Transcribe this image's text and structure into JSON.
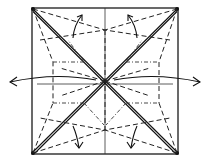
{
  "diagram": {
    "title": "Origami crease pattern with fold arrows",
    "square": {
      "x": 32,
      "y": 8,
      "size": 146
    },
    "colors": {
      "line": "#1a1a1a",
      "background": "#ffffff"
    },
    "line_types": [
      "edge",
      "valley-dashed",
      "mountain-dash-dot",
      "double-diagonal",
      "thin-reference"
    ],
    "arrows": [
      {
        "id": "left",
        "direction": "left"
      },
      {
        "id": "right",
        "direction": "right"
      },
      {
        "id": "top-left",
        "direction": "up"
      },
      {
        "id": "top-right",
        "direction": "up"
      },
      {
        "id": "bottom-left",
        "direction": "down"
      },
      {
        "id": "bottom-right",
        "direction": "down"
      }
    ]
  }
}
